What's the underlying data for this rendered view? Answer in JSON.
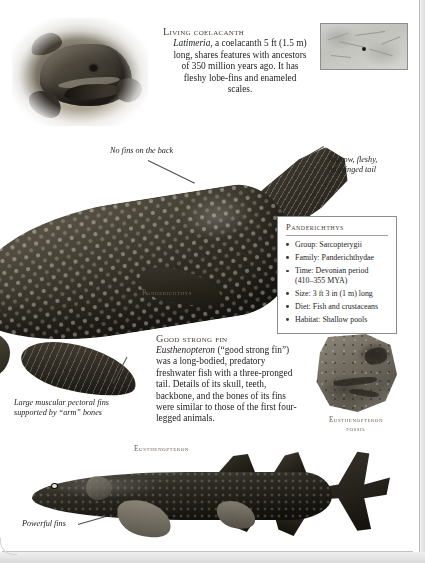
{
  "page": {
    "coelacanth_section": {
      "heading": "Living coelacanth",
      "genus": "Latimeria",
      "body": ", a coelacanth 5 ft (1.5 m) long, shares features with ancestors of 350 million years ago. It has fleshy lobe-fins and enameled scales."
    },
    "map_thumbnail": {
      "name": "distribution-map"
    },
    "panderichthys": {
      "species_label": "Panderichthys",
      "callout_no_fins": "No fins on the back",
      "callout_tail": "Narrow, fleshy, fin-fringed tail",
      "callout_pectoral": "Large muscular pectoral fins supported by “arm” bones"
    },
    "fact_box": {
      "title": "Panderichthys",
      "items": [
        "Group: Sarcopterygii",
        "Family: Panderichthydae",
        "Time: Devonian period (410–355 MYA)",
        "Size: 3 ft 3 in (1 m) long",
        "Diet: Fish and crustaceans",
        "Habitat: Shallow pools"
      ]
    },
    "eusthenopteron_section": {
      "heading": "Good strong fin",
      "genus": "Eusthenopteron",
      "body": " (“good strong fin”) was a long-bodied, predatory freshwater fish with a three-pronged tail. Details of its skull, teeth, backbone, and the bones of its fins were similar to those of the first four-legged animals."
    },
    "fossil": {
      "caption_line1": "Eusthenopteron",
      "caption_line2": "fossil"
    },
    "eusthenopteron_illustration": {
      "species_label": "Eusthenopteron",
      "callout_fins": "Powerful fins"
    },
    "colors": {
      "paper": "#ffffff",
      "ink": "#1d1d1d",
      "smallcaps": "#4a4137",
      "rule": "#8c8c8c",
      "leader": "#4d4d4d"
    }
  }
}
